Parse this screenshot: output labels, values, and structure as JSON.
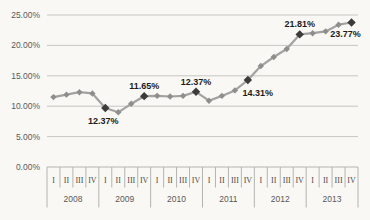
{
  "chart_data": {
    "type": "line",
    "title": "",
    "unit": "%",
    "ylim": [
      0,
      25
    ],
    "y_tick_step": 5,
    "y_tick_labels": [
      "0.00%",
      "5.00%",
      "10.00%",
      "15.00%",
      "20.00%",
      "25.00%"
    ],
    "grid": true,
    "legend_position": "none",
    "x_axis": {
      "years": [
        "2008",
        "2009",
        "2010",
        "2011",
        "2012",
        "2013"
      ],
      "quarters_per_year": [
        "I",
        "II",
        "III",
        "IV"
      ]
    },
    "series": [
      {
        "name": "quarterly-percentage-series",
        "values": [
          11.5,
          11.9,
          12.3,
          12.1,
          9.7,
          9.0,
          10.4,
          11.65,
          11.7,
          11.6,
          11.7,
          12.37,
          10.9,
          11.7,
          12.6,
          14.31,
          16.6,
          18.1,
          19.4,
          21.81,
          22.0,
          22.3,
          23.4,
          23.77
        ],
        "point_labels": [
          {
            "index": 4,
            "text": "12.37%",
            "placement": "below"
          },
          {
            "index": 7,
            "text": "11.65%",
            "placement": "above"
          },
          {
            "index": 11,
            "text": "12.37%",
            "placement": "above"
          },
          {
            "index": 15,
            "text": "14.31%",
            "placement": "below-right"
          },
          {
            "index": 19,
            "text": "21.81%",
            "placement": "above"
          },
          {
            "index": 23,
            "text": "23.77%",
            "placement": "below-left"
          }
        ]
      }
    ],
    "colors": {
      "background": "#f9f8f5",
      "gridline": "#c6c6c3",
      "axis_line": "#b4b4b1",
      "line": "#a2a2a0",
      "marker": "#8e8e8c",
      "labeled_marker": "#3b3b39",
      "axis_text": "#58585a",
      "quarter_text": "#4a4a4c",
      "point_label_text": "#1c1c1c"
    }
  }
}
